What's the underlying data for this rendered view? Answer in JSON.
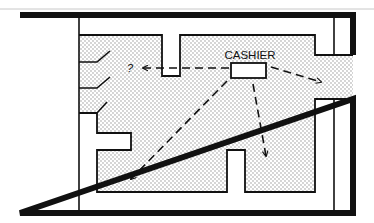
{
  "diagram": {
    "type": "floor-plan",
    "labels": {
      "cashier": "CASHIER",
      "question": "?"
    },
    "colors": {
      "wall": "#111111",
      "floor_dots": "#8a8a8a",
      "background": "#ffffff",
      "top_rule": "#c8c8c8"
    },
    "elements": {
      "cashier_desk": "rectangle",
      "arrows": [
        {
          "name": "arrow-to-question",
          "direction": "left",
          "style": "dashed"
        },
        {
          "name": "arrow-to-right-exit",
          "direction": "right-down",
          "style": "dashed"
        },
        {
          "name": "arrow-to-lower-left",
          "direction": "down-left",
          "style": "dashed"
        },
        {
          "name": "arrow-down",
          "direction": "down",
          "style": "dashed"
        }
      ],
      "doors": 3
    }
  }
}
